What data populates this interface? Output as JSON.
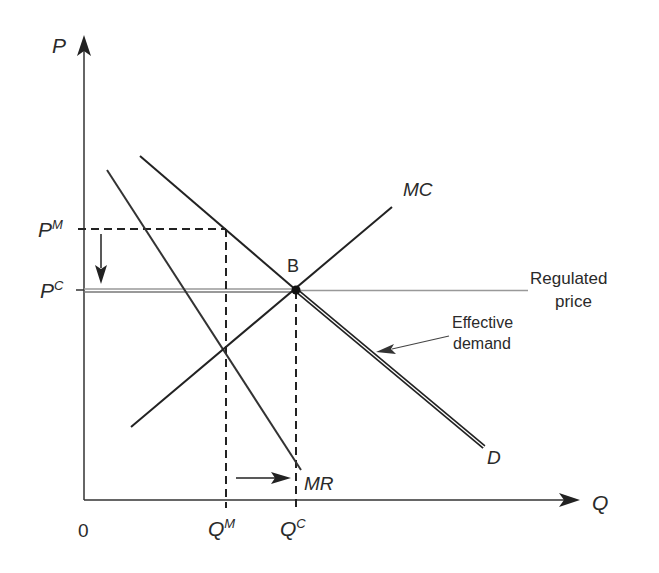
{
  "axes": {
    "y_label": "P",
    "x_label": "Q",
    "origin_label": "0"
  },
  "price_labels": {
    "monopoly": {
      "base": "P",
      "sup": "M"
    },
    "competitive": {
      "base": "P",
      "sup": "C"
    }
  },
  "quantity_labels": {
    "monopoly": {
      "base": "Q",
      "sup": "M"
    },
    "competitive": {
      "base": "Q",
      "sup": "C"
    }
  },
  "curves": {
    "mc": "MC",
    "demand": "D",
    "mr": "MR"
  },
  "point_label": "B",
  "annotations": {
    "regulated_price_line1": "Regulated",
    "regulated_price_line2": "price",
    "effective_demand_line1": "Effective",
    "effective_demand_line2": "demand"
  },
  "colors": {
    "line": "#222222",
    "regulated": "#888888",
    "text": "#2a2a2a"
  }
}
